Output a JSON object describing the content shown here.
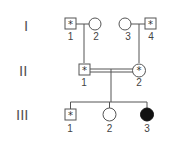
{
  "pedigree": {
    "generations": [
      {
        "label": "I"
      },
      {
        "label": "II"
      },
      {
        "label": "III"
      }
    ],
    "individuals": {
      "I-1": {
        "number": "1",
        "sex": "male",
        "marker": "*",
        "affected": false
      },
      "I-2": {
        "number": "2",
        "sex": "female",
        "marker": "",
        "affected": false
      },
      "I-3": {
        "number": "3",
        "sex": "female",
        "marker": "",
        "affected": false
      },
      "I-4": {
        "number": "4",
        "sex": "male",
        "marker": "*",
        "affected": false
      },
      "II-1": {
        "number": "1",
        "sex": "male",
        "marker": "*",
        "affected": false
      },
      "II-2": {
        "number": "2",
        "sex": "female",
        "marker": "*",
        "affected": false
      },
      "III-1": {
        "number": "1",
        "sex": "male",
        "marker": "*",
        "affected": false
      },
      "III-2": {
        "number": "2",
        "sex": "female",
        "marker": "",
        "affected": false
      },
      "III-3": {
        "number": "3",
        "sex": "female",
        "marker": "",
        "affected": true
      }
    },
    "consanguineous_marriage": "II-1 x II-2"
  },
  "colors": {
    "line": "#555555",
    "affected_fill": "#111111",
    "background": "#ffffff"
  }
}
